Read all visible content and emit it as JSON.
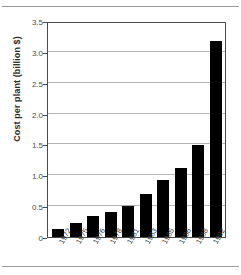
{
  "chart_data": {
    "type": "bar",
    "title": "",
    "xlabel": "",
    "ylabel": "Cost per plant (billion $)",
    "categories": [
      "1972",
      "1975",
      "1976",
      "1978",
      "1981",
      "1983",
      "1985",
      "1986",
      "1988",
      "1992"
    ],
    "values": [
      0.13,
      0.23,
      0.34,
      0.4,
      0.5,
      0.69,
      0.92,
      1.12,
      1.49,
      3.17
    ],
    "ylim": [
      0,
      3.5
    ],
    "yticks": [
      "0",
      "0.5",
      "1.0",
      "1.5",
      "2.0",
      "2.5",
      "3.0",
      "3.5"
    ],
    "ytick_values": [
      0,
      0.5,
      1.0,
      1.5,
      2.0,
      2.5,
      3.0,
      3.5
    ],
    "grid": "horizontal",
    "legend": "none",
    "bar_color": "#000000",
    "grid_color": "#b5b5b5",
    "axis_color": "#4a4a4a"
  }
}
